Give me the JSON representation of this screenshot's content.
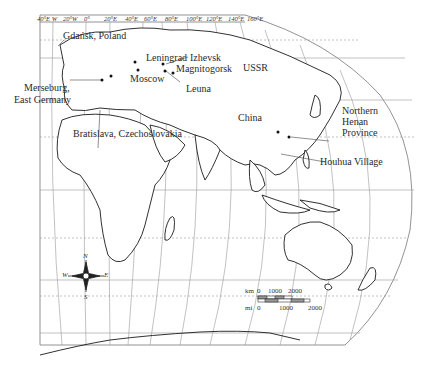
{
  "map": {
    "projection_note": "world map centered on Eurasia/Africa with graticule",
    "longitude_ticks": [
      "40°E W",
      "20°W",
      "0°",
      "20°E",
      "40°E",
      "60°E",
      "80°E",
      "100°E",
      "120°E",
      "140°E",
      "160°E"
    ],
    "labels": {
      "gdansk": "Gdańsk, Poland",
      "leningrad": "Leningrad",
      "izhevsk": "Izhevsk",
      "magnitogorsk": "Magnitogorsk",
      "ussr": "USSR",
      "moscow": "Moscow",
      "leuna": "Leuna",
      "merseburg_line1": "Merseburg,",
      "merseburg_line2": "East Germany",
      "bratislava": "Bratislava, Czechoslovakia",
      "china": "China",
      "henan_line1": "Northern",
      "henan_line2": "Henan",
      "henan_line3": "Province",
      "houhua": "Houhua Village"
    },
    "compass": {
      "n": "N",
      "s": "S",
      "e": "E",
      "w": "W"
    },
    "scale": {
      "km_label": "km",
      "km_ticks": [
        "0",
        "1000",
        "2000"
      ],
      "mi_label": "mi",
      "mi_ticks": [
        "0",
        "1000",
        "2000"
      ]
    },
    "colors": {
      "line": "#555555",
      "coast": "#1a1a1a",
      "graticule": "#8a8a8a",
      "background": "#ffffff"
    }
  }
}
